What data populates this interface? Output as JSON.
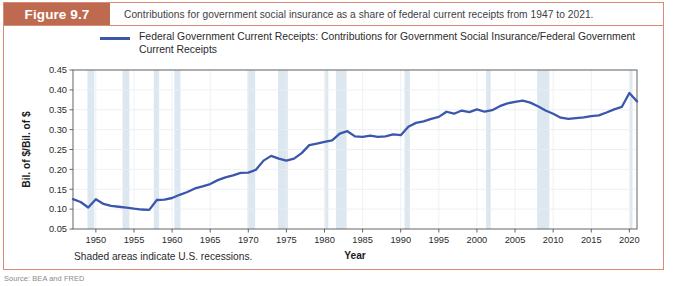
{
  "figure": {
    "label": "Figure 9.7",
    "caption": "Contributions for government social insurance as a share of federal current receipts from 1947 to 2021.",
    "footnote": "Shaded areas indicate U.S. recessions.",
    "source": "Source: BEA and FRED"
  },
  "colors": {
    "header_bar": "#bd6a50",
    "card_border": "#d98b74",
    "line": "#3b57ad",
    "recession_band": "#dde7ef",
    "grid": "#e8eef3",
    "axis": "#555555"
  },
  "chart_data": {
    "type": "line",
    "title": "",
    "xlabel": "Year",
    "ylabel": "Bil. of $/Bil. of $",
    "xlim": [
      1947,
      2021
    ],
    "ylim": [
      0.05,
      0.45
    ],
    "grid": true,
    "legend_position": "top",
    "xticks": [
      1950,
      1955,
      1960,
      1965,
      1970,
      1975,
      1980,
      1985,
      1990,
      1995,
      2000,
      2005,
      2010,
      2015,
      2020
    ],
    "yticks": [
      0.05,
      0.1,
      0.15,
      0.2,
      0.25,
      0.3,
      0.35,
      0.4,
      0.45
    ],
    "series": [
      {
        "name": "Federal Government Current Receipts: Contributions for Government Social Insurance/Federal Government Current Receipts",
        "color": "#3b57ad",
        "x": [
          1947,
          1948,
          1949,
          1950,
          1951,
          1952,
          1953,
          1954,
          1955,
          1956,
          1957,
          1958,
          1959,
          1960,
          1961,
          1962,
          1963,
          1964,
          1965,
          1966,
          1967,
          1968,
          1969,
          1970,
          1971,
          1972,
          1973,
          1974,
          1975,
          1976,
          1977,
          1978,
          1979,
          1980,
          1981,
          1982,
          1983,
          1984,
          1985,
          1986,
          1987,
          1988,
          1989,
          1990,
          1991,
          1992,
          1993,
          1994,
          1995,
          1996,
          1997,
          1998,
          1999,
          2000,
          2001,
          2002,
          2003,
          2004,
          2005,
          2006,
          2007,
          2008,
          2009,
          2010,
          2011,
          2012,
          2013,
          2014,
          2015,
          2016,
          2017,
          2018,
          2019,
          2020,
          2021
        ],
        "y": [
          0.125,
          0.118,
          0.104,
          0.125,
          0.113,
          0.108,
          0.106,
          0.104,
          0.101,
          0.099,
          0.098,
          0.123,
          0.124,
          0.128,
          0.136,
          0.143,
          0.152,
          0.157,
          0.163,
          0.173,
          0.18,
          0.185,
          0.191,
          0.192,
          0.199,
          0.222,
          0.234,
          0.227,
          0.222,
          0.227,
          0.241,
          0.261,
          0.265,
          0.269,
          0.273,
          0.29,
          0.296,
          0.283,
          0.282,
          0.285,
          0.282,
          0.283,
          0.288,
          0.286,
          0.307,
          0.317,
          0.321,
          0.327,
          0.332,
          0.345,
          0.34,
          0.348,
          0.344,
          0.351,
          0.345,
          0.349,
          0.359,
          0.366,
          0.37,
          0.373,
          0.368,
          0.359,
          0.348,
          0.34,
          0.33,
          0.327,
          0.329,
          0.331,
          0.334,
          0.336,
          0.343,
          0.351,
          0.357,
          0.392,
          0.371
        ],
        "annotations": [
          {
            "year": 1949,
            "value": 0.104,
            "note": "early trough"
          },
          {
            "year": 1957,
            "value": 0.098,
            "note": "minimum"
          },
          {
            "year": 2020,
            "value": 0.392,
            "note": "maximum"
          },
          {
            "year": 2021,
            "value": 0.371,
            "note": "final value"
          }
        ]
      }
    ],
    "recession_bands": [
      {
        "start": 1948.9,
        "end": 1949.8
      },
      {
        "start": 1953.5,
        "end": 1954.4
      },
      {
        "start": 1957.6,
        "end": 1958.3
      },
      {
        "start": 1960.3,
        "end": 1961.1
      },
      {
        "start": 1969.9,
        "end": 1970.9
      },
      {
        "start": 1973.9,
        "end": 1975.2
      },
      {
        "start": 1980.1,
        "end": 1980.5
      },
      {
        "start": 1981.5,
        "end": 1982.9
      },
      {
        "start": 1990.5,
        "end": 1991.2
      },
      {
        "start": 2001.2,
        "end": 2001.8
      },
      {
        "start": 2007.9,
        "end": 2009.5
      },
      {
        "start": 2020.1,
        "end": 2020.4
      }
    ]
  }
}
